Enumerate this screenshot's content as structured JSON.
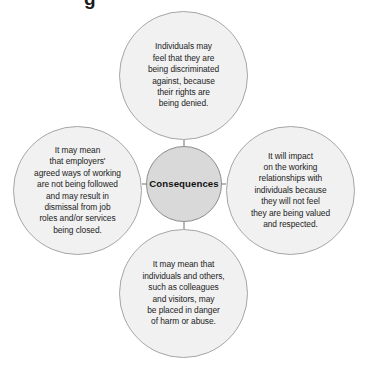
{
  "diagram": {
    "type": "hub-and-spoke",
    "partial_heading_fragment": "g",
    "center": {
      "label": "Consequences",
      "fill_color": "#d9d9d9",
      "border_color": "#8c8c8c",
      "text_color": "#111111"
    },
    "satellite_fill_color": "#f1f1f1",
    "satellite_border_color": "#a6a6a6",
    "satellite_text_color": "#1c1c1c",
    "connector_color": "#999999",
    "nodes": [
      {
        "position": "top",
        "text": "Individuals may\nfeel that they are\nbeing discriminated\nagainst, because\ntheir rights are\nbeing denied."
      },
      {
        "position": "left",
        "text": "It may mean\nthat employers'\nagreed ways of working\nare not being followed\nand may result in\ndismissal from job\nroles and/or services\nbeing closed."
      },
      {
        "position": "right",
        "text": "It will impact\non the working\nrelationships with\nindividuals because\nthey will not feel\nthey are being valued\nand respected."
      },
      {
        "position": "bottom",
        "text": "It may mean that\nindividuals and others,\nsuch as colleagues\nand visitors, may\nbe placed in danger\nof harm or abuse."
      }
    ]
  }
}
